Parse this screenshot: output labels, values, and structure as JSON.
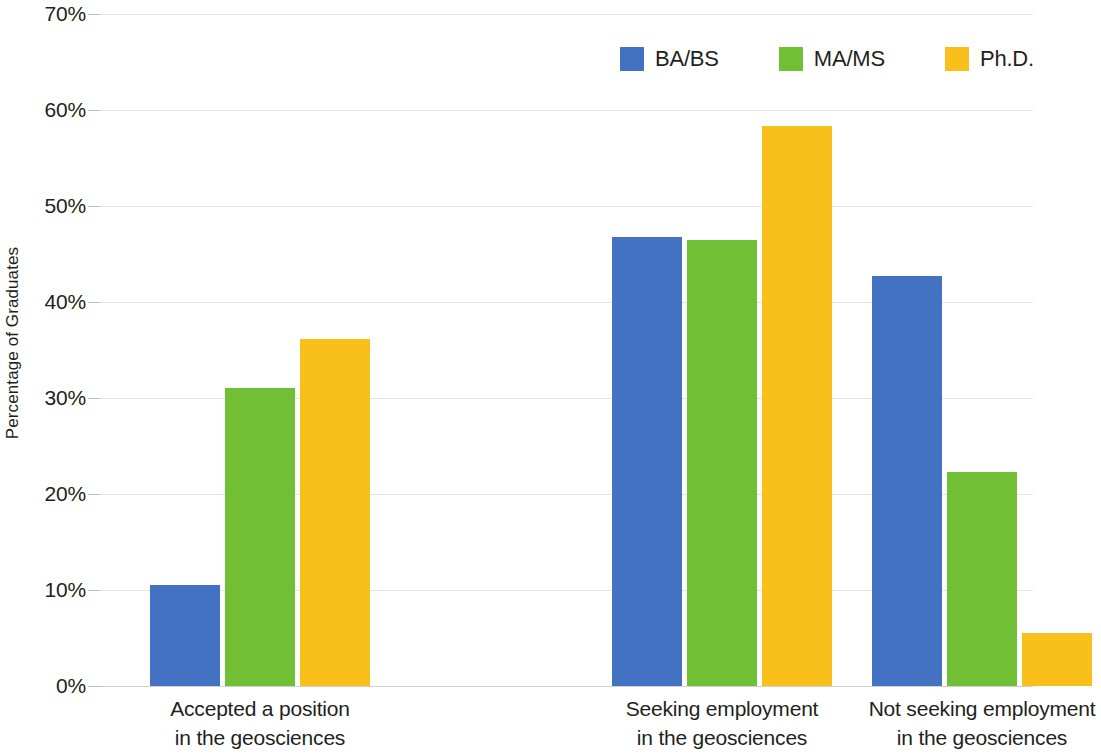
{
  "chart_data": {
    "type": "bar",
    "title": "",
    "subtitle": "",
    "xlabel": "",
    "ylabel": "Percentage of Graduates",
    "ylim": [
      0,
      70
    ],
    "y_tick_step": 10,
    "y_tick_labels": [
      "0%",
      "10%",
      "20%",
      "30%",
      "40%",
      "50%",
      "60%",
      "70%"
    ],
    "y_tick_values": [
      0,
      10,
      20,
      30,
      40,
      50,
      60,
      70
    ],
    "grid": true,
    "legend_position": "top-right",
    "categories": [
      "Accepted a position in the geosciences",
      "Seeking employment in the geosciences",
      "Not seeking employment in the geosciences"
    ],
    "category_lines": [
      [
        "Accepted a position",
        "in the geosciences"
      ],
      [
        "Seeking employment",
        "in the geosciences"
      ],
      [
        "Not seeking employment",
        "in the geosciences"
      ]
    ],
    "series": [
      {
        "name": "BA/BS",
        "color": "#4372c3",
        "values": [
          10.5,
          46.8,
          42.7
        ]
      },
      {
        "name": "MA/MS",
        "color": "#70bf35",
        "values": [
          31.0,
          46.5,
          22.3
        ]
      },
      {
        "name": "Ph.D.",
        "color": "#f9c01c",
        "values": [
          36.1,
          58.3,
          5.5
        ]
      }
    ],
    "units": "percent"
  },
  "legend": {
    "items": [
      {
        "label": "BA/BS"
      },
      {
        "label": "MA/MS"
      },
      {
        "label": "Ph.D."
      }
    ]
  },
  "colors": {
    "ba_bs": "#4372c3",
    "ma_ms": "#70bf35",
    "phd": "#f9c01c",
    "gridline": "#e4e4e4",
    "text": "#231f20",
    "background": "#ffffff"
  }
}
